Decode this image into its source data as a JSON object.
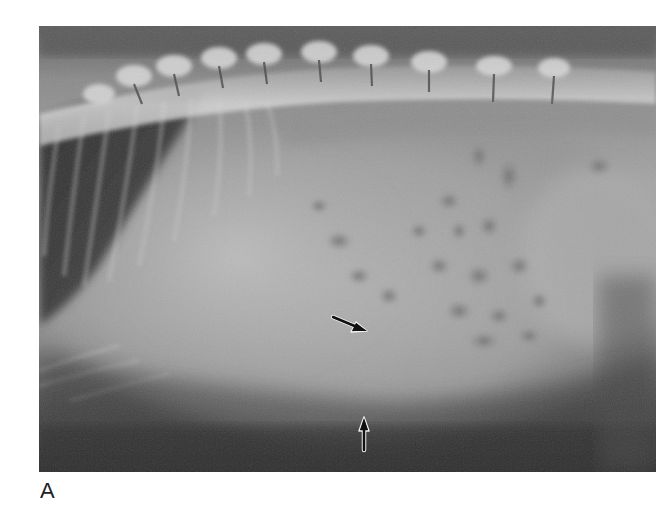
{
  "figure": {
    "panel_label": "A",
    "image": {
      "kind": "lateral abdominal radiograph",
      "annotations": [
        {
          "type": "arrow",
          "direction": "down-right",
          "name": "arrow-oblique"
        },
        {
          "type": "arrow",
          "direction": "up",
          "name": "arrow-vertical"
        }
      ]
    },
    "colors": {
      "background": "#ffffff",
      "arrow": "#111111",
      "arrow_outline": "#f0f0f0",
      "label": "#222222"
    }
  }
}
